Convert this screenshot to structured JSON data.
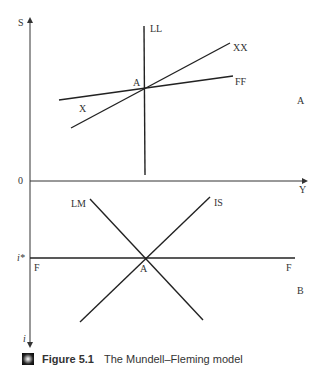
{
  "figure": {
    "caption_label": "Figure 5.1",
    "caption_text": "The Mundell–Fleming model",
    "caption_icon": "figure-bullet-icon"
  },
  "panel_a": {
    "panel_label": "A",
    "y_axis_label": "S",
    "x_axis_label": "Y",
    "origin_label": "0",
    "curves": {
      "ll": "LL",
      "xx": "XX",
      "ff": "FF",
      "x": "X"
    },
    "equilibrium_label": "A"
  },
  "panel_b": {
    "panel_label": "B",
    "y_axis_label": "i",
    "rate_label": "i*",
    "curves": {
      "lm": "LM",
      "is": "IS",
      "f_left": "F",
      "f_right": "F"
    },
    "equilibrium_label": "A"
  }
}
